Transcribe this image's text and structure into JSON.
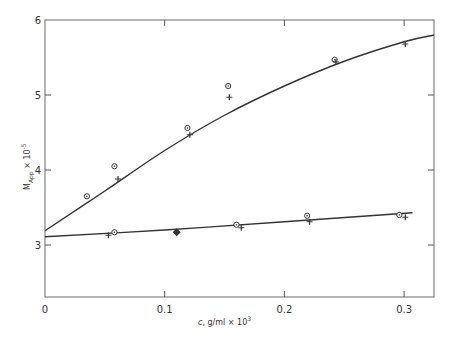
{
  "chart_data": {
    "type": "scatter",
    "title": "",
    "xlabel": "c , g/ml × 10³",
    "ylabel": "M_App × 10⁻⁵",
    "xlim": [
      0,
      0.325
    ],
    "ylim": [
      2.31,
      6.0
    ],
    "grid": false,
    "legend": "none",
    "x_ticks": [
      0,
      0.1,
      0.2,
      0.3
    ],
    "x_tick_labels": [
      "0",
      "0.1",
      "0.2",
      "0.3"
    ],
    "y_ticks": [
      3,
      4,
      5,
      6
    ],
    "y_tick_labels": [
      "3",
      "4",
      "5",
      "6"
    ],
    "series": [
      {
        "name": "upper-circles",
        "marker": "circle",
        "x": [
          0.035,
          0.058,
          0.119,
          0.153,
          0.242
        ],
        "y": [
          3.65,
          4.05,
          4.56,
          5.12,
          5.47
        ]
      },
      {
        "name": "upper-plus",
        "marker": "plus",
        "x": [
          0.061,
          0.121,
          0.154,
          0.243,
          0.301
        ],
        "y": [
          3.88,
          4.47,
          4.97,
          5.44,
          5.68
        ]
      },
      {
        "name": "lower-circles",
        "marker": "circle",
        "x": [
          0.058,
          0.16,
          0.219,
          0.296
        ],
        "y": [
          3.17,
          3.27,
          3.39,
          3.4
        ]
      },
      {
        "name": "lower-plus",
        "marker": "plus",
        "x": [
          0.053,
          0.164,
          0.221,
          0.301
        ],
        "y": [
          3.13,
          3.23,
          3.31,
          3.37
        ]
      },
      {
        "name": "lower-diamond",
        "marker": "diamond-filled",
        "x": [
          0.11
        ],
        "y": [
          3.17
        ]
      }
    ],
    "fit_curves": [
      {
        "name": "upper-fit",
        "x": [
          0,
          0.05,
          0.1,
          0.15,
          0.2,
          0.25,
          0.3,
          0.325
        ],
        "y": [
          3.19,
          3.72,
          4.26,
          4.73,
          5.12,
          5.45,
          5.71,
          5.8
        ]
      },
      {
        "name": "lower-fit",
        "x": [
          0,
          0.1,
          0.2,
          0.307
        ],
        "y": [
          3.11,
          3.2,
          3.31,
          3.43
        ]
      }
    ]
  },
  "axes": {
    "xlabel_main": "c",
    "xlabel_units": ", g/ml × 10",
    "xlabel_exp": "3",
    "ylabel_main": "M",
    "ylabel_sub": "App",
    "ylabel_mult": " × 10",
    "ylabel_exp": "-5"
  }
}
